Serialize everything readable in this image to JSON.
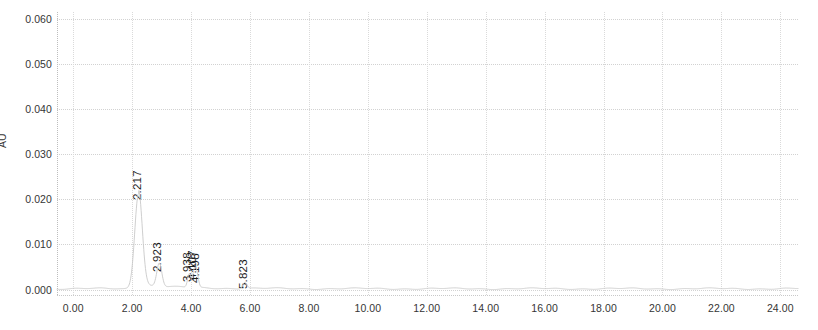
{
  "chart_data": {
    "type": "line",
    "title": "",
    "xlabel": "",
    "ylabel": "AU",
    "xlim": [
      -0.55,
      24.6
    ],
    "ylim": [
      -0.0012,
      0.0615
    ],
    "grid": true,
    "legend": "none",
    "x_ticks": [
      "0.00",
      "2.00",
      "4.00",
      "6.00",
      "8.00",
      "10.00",
      "12.00",
      "14.00",
      "16.00",
      "18.00",
      "20.00",
      "22.00",
      "24.00"
    ],
    "x_tick_values": [
      0,
      2,
      4,
      6,
      8,
      10,
      12,
      14,
      16,
      18,
      20,
      22,
      24
    ],
    "y_ticks": [
      "0.000",
      "0.010",
      "0.020",
      "0.030",
      "0.040",
      "0.050",
      "0.060"
    ],
    "y_tick_values": [
      0.0,
      0.01,
      0.02,
      0.03,
      0.04,
      0.05,
      0.06
    ],
    "trace_color": "#c8c8c8",
    "peaks": [
      {
        "label": "2.217",
        "rt": 2.217,
        "height": 0.0212,
        "width": 0.3
      },
      {
        "label": "2.923",
        "rt": 2.923,
        "height": 0.0052,
        "width": 0.2
      },
      {
        "label": "3.938",
        "rt": 3.938,
        "height": 0.003,
        "width": 0.13
      },
      {
        "label": "4.107",
        "rt": 4.107,
        "height": 0.0035,
        "width": 0.13
      },
      {
        "label": "4.198",
        "rt": 4.198,
        "height": 0.0028,
        "width": 0.13
      },
      {
        "label": "5.823",
        "rt": 5.823,
        "height": 0.0014,
        "width": 0.16
      }
    ],
    "baseline": 0.0002
  }
}
